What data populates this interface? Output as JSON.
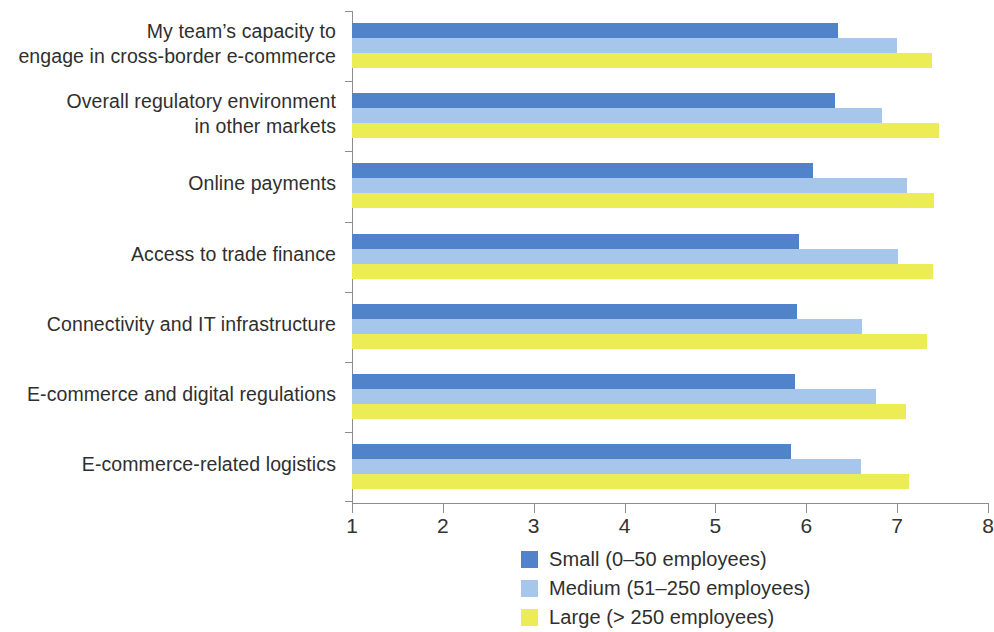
{
  "chart_data": {
    "type": "bar",
    "orientation": "horizontal",
    "title": "",
    "subtitle": "",
    "xlabel": "",
    "ylabel": "",
    "xlim": [
      1,
      8
    ],
    "xticks": [
      1,
      2,
      3,
      4,
      5,
      6,
      7,
      8
    ],
    "xtick_labels": [
      "1",
      "2",
      "3",
      "4",
      "5",
      "6",
      "7",
      "8"
    ],
    "grid": false,
    "legend_position": "bottom-center",
    "categories": [
      "My team’s capacity to\nengage in cross-border e-commerce",
      "Overall regulatory environment\nin other markets",
      "Online payments",
      "Access to trade finance",
      "Connectivity and IT infrastructure",
      "E-commerce and digital regulations",
      "E-commerce-related logistics"
    ],
    "series": [
      {
        "name": "Small (0–50 employees)",
        "color": "#5183ca",
        "values": [
          6.35,
          6.32,
          6.07,
          5.92,
          5.9,
          5.88,
          5.83
        ]
      },
      {
        "name": "Medium (51–250 employees)",
        "color": "#a6c6ec",
        "values": [
          7.0,
          6.83,
          7.11,
          7.01,
          6.61,
          6.77,
          6.6
        ]
      },
      {
        "name": "Large (> 250 employees)",
        "color": "#eced55",
        "values": [
          7.38,
          7.46,
          7.41,
          7.39,
          7.33,
          7.1,
          7.13
        ]
      }
    ]
  },
  "legend": {
    "items": [
      {
        "label": "Small (0–50 employees)",
        "color": "#5183ca"
      },
      {
        "label": "Medium (51–250 employees)",
        "color": "#a6c6ec"
      },
      {
        "label": "Large (> 250 employees)",
        "color": "#eced55"
      }
    ]
  }
}
